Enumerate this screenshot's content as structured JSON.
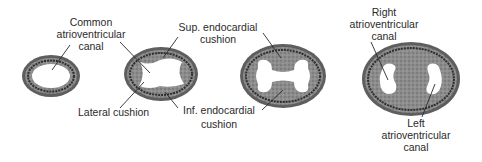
{
  "figure": {
    "colors": {
      "background": "#ffffff",
      "tissue_outer": "#6e6e6e",
      "tissue_inner": "#9a9a9a",
      "dark_band": "#3a3a3a",
      "lumen": "#ffffff",
      "text": "#2a2a2a"
    },
    "stages": [
      {
        "name": "stage-1",
        "labels": {
          "common_canal": [
            "Common",
            "atrioventricular",
            "canal"
          ]
        }
      },
      {
        "name": "stage-2",
        "labels": {
          "lateral_cushion": "Lateral cushion",
          "sup_cushion": [
            "Sup. endocardial",
            "cushion"
          ],
          "inf_cushion": [
            "Inf. endocardial",
            "cushion"
          ]
        }
      },
      {
        "name": "stage-3",
        "labels": {}
      },
      {
        "name": "stage-4",
        "labels": {
          "right_canal": [
            "Right",
            "atrioventricular",
            "canal"
          ],
          "left_canal": [
            "Left",
            "atrioventricular",
            "canal"
          ]
        }
      }
    ]
  }
}
